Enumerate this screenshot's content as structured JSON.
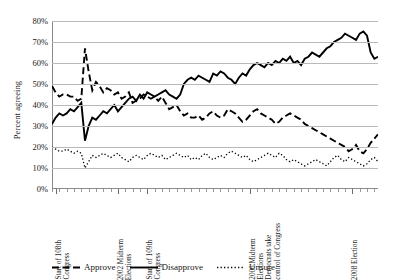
{
  "chart_data": {
    "type": "line",
    "title": "",
    "xlabel": "",
    "ylabel": "Percent agreeing",
    "ylim": [
      0,
      80
    ],
    "ytick_labels": [
      "0%",
      "10%",
      "20%",
      "30%",
      "40%",
      "50%",
      "60%",
      "70%",
      "80%"
    ],
    "ytick_values": [
      0,
      10,
      20,
      30,
      40,
      50,
      60,
      70,
      80
    ],
    "grid": true,
    "legend_position": "bottom",
    "x_annotations": [
      {
        "label": "Start of 108th\nCongress",
        "index": 1
      },
      {
        "label": "2002 Midterm\nElections",
        "index": 18
      },
      {
        "label": "Start of 109th\nCongress",
        "index": 26
      },
      {
        "label": "2006 Midterm\nElections\nDemocrats take\ncontrol of Congress",
        "index": 54
      },
      {
        "label": "2008 Election",
        "index": 82
      }
    ],
    "series": [
      {
        "name": "Approve",
        "style": "dashed",
        "values": [
          49,
          46,
          44,
          45,
          45,
          44,
          44,
          42,
          43,
          67,
          56,
          47,
          51,
          49,
          46,
          48,
          47,
          45,
          46,
          43,
          44,
          46,
          41,
          42,
          43,
          45,
          44,
          43,
          44,
          42,
          44,
          41,
          38,
          39,
          40,
          37,
          35,
          36,
          34,
          34,
          35,
          33,
          34,
          36,
          37,
          35,
          34,
          35,
          38,
          37,
          36,
          34,
          32,
          33,
          35,
          37,
          38,
          36,
          35,
          34,
          33,
          31,
          32,
          34,
          35,
          36,
          35,
          34,
          33,
          31,
          30,
          29,
          28,
          27,
          26,
          25,
          24,
          23,
          22,
          21,
          20,
          18,
          19,
          21,
          18,
          17,
          19,
          22,
          24,
          26
        ]
      },
      {
        "name": "Disapprove",
        "style": "solid",
        "values": [
          31,
          34,
          36,
          35,
          36,
          38,
          37,
          39,
          41,
          23,
          30,
          34,
          33,
          35,
          37,
          36,
          38,
          40,
          37,
          39,
          41,
          43,
          44,
          42,
          45,
          43,
          46,
          45,
          44,
          45,
          46,
          47,
          45,
          44,
          43,
          45,
          50,
          52,
          53,
          52,
          54,
          53,
          52,
          51,
          55,
          54,
          56,
          55,
          53,
          52,
          50,
          53,
          55,
          54,
          57,
          59,
          60,
          59,
          58,
          60,
          59,
          61,
          60,
          62,
          61,
          63,
          60,
          61,
          59,
          62,
          63,
          65,
          64,
          63,
          65,
          67,
          68,
          70,
          71,
          72,
          74,
          73,
          72,
          71,
          74,
          75,
          73,
          65,
          62,
          63
        ]
      },
      {
        "name": "Unsure",
        "style": "dotted",
        "values": [
          20,
          19,
          18,
          18,
          19,
          18,
          17,
          18,
          17,
          10,
          13,
          16,
          15,
          16,
          17,
          16,
          15,
          16,
          17,
          15,
          14,
          13,
          15,
          16,
          15,
          14,
          16,
          17,
          16,
          15,
          16,
          14,
          15,
          16,
          17,
          16,
          15,
          16,
          14,
          15,
          14,
          16,
          17,
          15,
          14,
          15,
          16,
          15,
          17,
          18,
          17,
          16,
          15,
          16,
          14,
          13,
          14,
          15,
          16,
          17,
          16,
          15,
          17,
          16,
          14,
          13,
          14,
          13,
          12,
          11,
          12,
          13,
          14,
          13,
          12,
          11,
          13,
          15,
          16,
          14,
          13,
          15,
          14,
          13,
          12,
          11,
          12,
          14,
          15,
          13
        ]
      }
    ]
  },
  "legend": {
    "items": [
      {
        "label": "Approve",
        "style": "dashed"
      },
      {
        "label": "Disapprove",
        "style": "solid"
      },
      {
        "label": "Unsure",
        "style": "dotted"
      }
    ]
  }
}
